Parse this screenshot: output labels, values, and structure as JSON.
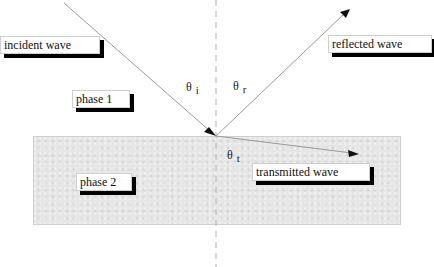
{
  "diagram": {
    "labels": {
      "incident": "incident wave",
      "reflected": "reflected wave",
      "transmitted": "transmitted wave",
      "phase1": "phase 1",
      "phase2": "phase 2"
    },
    "angles": {
      "incidence": {
        "symbol": "θ",
        "sub": "i"
      },
      "reflection": {
        "symbol": "θ",
        "sub": "r"
      },
      "transmission": {
        "symbol": "θ",
        "sub": "t"
      }
    },
    "colors": {
      "ray": "#9a9a9a",
      "normal": "#b0b0b0",
      "slab": "#e6e6e6",
      "shadow": "#000000"
    }
  }
}
